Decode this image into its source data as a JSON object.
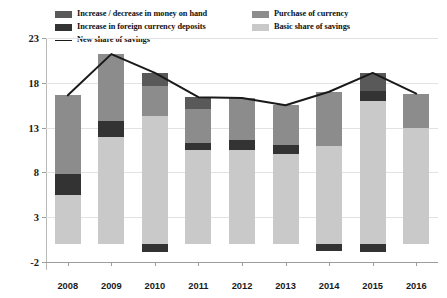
{
  "legend": {
    "items": [
      {
        "label": "Increase / decrease in money on hand",
        "color": "#595959",
        "type": "swatch",
        "icon": "legend-swatch-icon"
      },
      {
        "label": "Increase in foreign currency deposits",
        "color": "#333333",
        "type": "swatch",
        "icon": "legend-swatch-icon"
      },
      {
        "label": "New share of savings",
        "color": "#1a1a1a",
        "type": "line",
        "icon": "legend-line-icon"
      },
      {
        "label": "Purchase of currency",
        "color": "#8c8c8c",
        "type": "swatch",
        "icon": "legend-swatch-icon"
      },
      {
        "label": "Basic share of savings",
        "color": "#c9c9c9",
        "type": "swatch",
        "icon": "legend-swatch-icon"
      }
    ]
  },
  "axes": {
    "y_ticks": [
      23,
      18,
      13,
      8,
      3,
      -2
    ],
    "y_tick_labels": [
      "23",
      "18",
      "13",
      "8",
      "3",
      "-2"
    ],
    "ylim": [
      -2,
      23
    ],
    "x_tick_labels": [
      "2008",
      "2009",
      "2010",
      "2011",
      "2012",
      "2013",
      "2014",
      "2015",
      "2016"
    ]
  },
  "chart_data": {
    "type": "bar",
    "title": "",
    "subtitle": "",
    "xlabel": "",
    "ylabel": "",
    "ylim": [
      -2,
      23
    ],
    "xlim_categories": 9,
    "grid": true,
    "legend_position": "top",
    "stacked": true,
    "categories": [
      "2008",
      "2009",
      "2010",
      "2011",
      "2012",
      "2013",
      "2014",
      "2015",
      "2016"
    ],
    "series": [
      {
        "name": "Basic share of savings",
        "color": "#c9c9c9",
        "values": [
          5.5,
          12.0,
          14.3,
          10.5,
          10.5,
          10.0,
          11.0,
          16.0,
          13.0
        ]
      },
      {
        "name": "Increase in foreign currency deposits",
        "color": "#333333",
        "values": [
          2.3,
          1.7,
          0.0,
          0.8,
          1.1,
          1.1,
          0.0,
          1.1,
          0.0
        ]
      },
      {
        "name": "Purchase of currency",
        "color": "#8c8c8c",
        "values": [
          8.8,
          7.5,
          3.3,
          3.8,
          4.7,
          4.4,
          6.0,
          0.0,
          3.8
        ]
      },
      {
        "name": "Increase / decrease in money on hand",
        "color": "#595959",
        "values": [
          0.0,
          0.0,
          1.5,
          1.3,
          0.0,
          0.0,
          0.0,
          2.0,
          0.0
        ]
      },
      {
        "name": "Increase / decrease in money on hand (negative)",
        "color": "#333333",
        "values": [
          0.0,
          0.0,
          -0.9,
          0.0,
          0.0,
          0.0,
          -0.8,
          -0.9,
          0.0
        ]
      }
    ],
    "line_series": {
      "name": "New share of savings",
      "color": "#1a1a1a",
      "values": [
        16.6,
        21.2,
        19.1,
        16.4,
        16.3,
        15.5,
        17.0,
        19.1,
        16.8
      ]
    }
  }
}
